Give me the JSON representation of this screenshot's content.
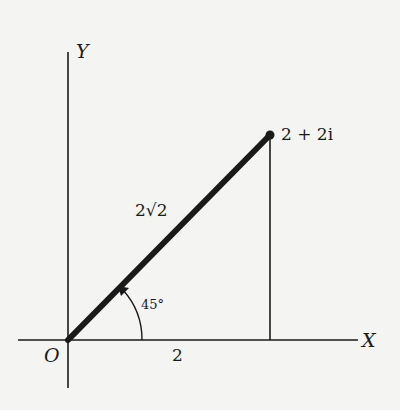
{
  "diagram": {
    "type": "argand-diagram",
    "axes": {
      "x_label": "X",
      "y_label": "Y",
      "origin_label": "O"
    },
    "point": {
      "label": "2 + 2i",
      "real": 2,
      "imag": 2
    },
    "tick": {
      "label": "2"
    },
    "modulus": {
      "label": "2√2"
    },
    "angle": {
      "label": "45°",
      "degrees": 45
    },
    "colors": {
      "background": "#f4f4f2",
      "ink": "#1a1a1a"
    }
  }
}
